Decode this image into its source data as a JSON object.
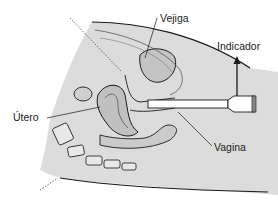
{
  "diagram": {
    "type": "anatomical-illustration",
    "view": "sagittal cross-section, female pelvis with inserted probe",
    "labels": {
      "bladder": "Vejiga",
      "indicator": "Indicador",
      "uterus": "Útero",
      "vagina": "Vagina"
    },
    "colors": {
      "skin": "#d9d9d9",
      "tissue": "#c8c8c8",
      "outline": "#1a1a1a",
      "probe": "#ffffff",
      "probe_tip": "#888888"
    }
  }
}
